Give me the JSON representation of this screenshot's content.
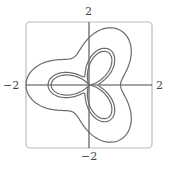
{
  "chart_data": {
    "type": "line",
    "subtype": "polar-curves",
    "title": "",
    "xlabel": "",
    "ylabel": "",
    "xlim": [
      -2,
      2
    ],
    "ylim": [
      -2,
      2
    ],
    "tick_labels": {
      "x_min": "−2",
      "x_max": "2",
      "y_min": "−2",
      "y_max": "2"
    },
    "grid": false,
    "legend": null,
    "frame": "rounded box",
    "series": [
      {
        "name": "outer curve",
        "equation": "r = 1.5 - 0.5 cos(3θ)",
        "a": 1.5,
        "b": 0.5,
        "r_range": [
          1.0,
          2.0
        ]
      },
      {
        "name": "middle curve",
        "equation": "r = 0.8 - 0.5 cos(3θ)",
        "a": 0.8,
        "b": 0.5,
        "r_range": [
          0.3,
          1.3
        ]
      },
      {
        "name": "inner curve",
        "equation": "r = 0.6 - 0.6 cos(3θ)",
        "a": 0.6,
        "b": 0.6,
        "r_range": [
          0.0,
          1.2
        ]
      }
    ],
    "colors": {
      "curve": "#6b6b6b",
      "axis": "#4a4a4a",
      "frame": "#bdbdbd"
    }
  }
}
